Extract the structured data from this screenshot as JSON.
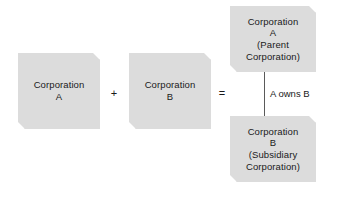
{
  "figure": {
    "background_color": "#ffffff",
    "box_fill_color": "#dcdcdc",
    "text_color": "#1a1a1a",
    "connector_color": "#5a5a5a"
  },
  "boxes": {
    "corporation_a": {
      "label": "Corporation\nA"
    },
    "corporation_b": {
      "label": "Corporation\nB"
    },
    "parent_corporation_a": {
      "label": "Corporation\nA\n(Parent\nCorporation)"
    },
    "subsidiary_corporation_b": {
      "label": "Corporation\nB\n(Subsidiary\nCorporation)"
    }
  },
  "operators": {
    "plus": "+",
    "equals": "="
  },
  "connector": {
    "label": "A owns B"
  }
}
